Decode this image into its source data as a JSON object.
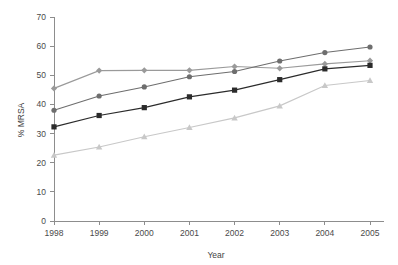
{
  "chart_data": {
    "type": "line",
    "title": "",
    "xlabel": "Year",
    "ylabel": "% MRSA",
    "categories": [
      "1998",
      "1999",
      "2000",
      "2001",
      "2002",
      "2003",
      "2004",
      "2005"
    ],
    "x": [
      1998,
      1999,
      2000,
      2001,
      2002,
      2003,
      2004,
      2005
    ],
    "xlim": [
      1998,
      2005
    ],
    "ylim": [
      0,
      70
    ],
    "yticks": [
      0,
      10,
      20,
      30,
      40,
      50,
      60,
      70
    ],
    "ytick_labels": [
      "0",
      "10",
      "20",
      "30",
      "40",
      "50",
      "60",
      "70"
    ],
    "grid": false,
    "legend": "none",
    "series": [
      {
        "name": "series-1",
        "marker": "diamond",
        "color": "#9a9a9a",
        "values": [
          45.5,
          51.6,
          51.7,
          51.7,
          53.0,
          52.4,
          53.9,
          55.0
        ]
      },
      {
        "name": "series-2",
        "marker": "circle",
        "color": "#6e6e6e",
        "values": [
          38.0,
          42.9,
          46.0,
          49.5,
          51.3,
          54.9,
          57.8,
          59.7
        ]
      },
      {
        "name": "series-3",
        "marker": "square",
        "color": "#2b2b2b",
        "values": [
          32.3,
          36.2,
          38.9,
          42.6,
          44.9,
          48.5,
          52.2,
          53.4
        ]
      },
      {
        "name": "series-4",
        "marker": "triangle",
        "color": "#c8c8c8",
        "values": [
          22.6,
          25.4,
          28.9,
          32.1,
          35.4,
          39.5,
          46.5,
          48.2
        ]
      }
    ]
  },
  "axes": {
    "y_axis_title": "% MRSA",
    "x_axis_title": "Year",
    "y_tick_labels": [
      "70",
      "60",
      "50",
      "40",
      "30",
      "20",
      "10",
      "0"
    ],
    "x_tick_labels": [
      "1998",
      "1999",
      "2000",
      "2001",
      "2002",
      "2003",
      "2004",
      "2005"
    ]
  }
}
